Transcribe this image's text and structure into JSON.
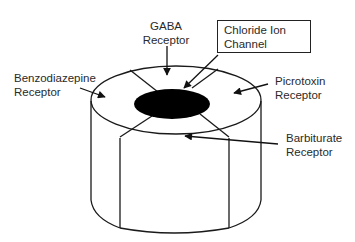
{
  "diagram": {
    "labels": {
      "gaba": {
        "line1": "GABA",
        "line2": "Receptor"
      },
      "chloride": {
        "line1": "Chloride Ion",
        "line2": "Channel"
      },
      "benzodiazepine": {
        "line1": "Benzodiazepine",
        "line2": "Receptor"
      },
      "picrotoxin": {
        "line1": "Picrotoxin",
        "line2": "Receptor"
      },
      "barbiturate": {
        "line1": "Barbiturate",
        "line2": "Receptor"
      }
    },
    "colors": {
      "stroke": "#1a1a1a",
      "channel_fill": "#000000",
      "background": "#ffffff"
    }
  }
}
